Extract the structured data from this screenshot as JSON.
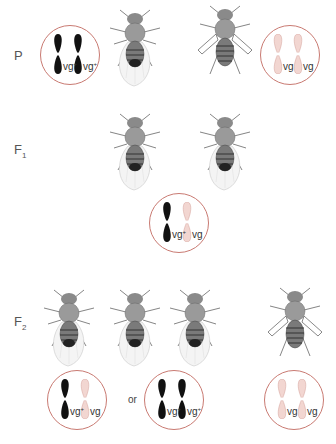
{
  "colors": {
    "circle_border": "#c97a72",
    "dominant_chromosome": "#111111",
    "recessive_chromosome": "#f2d6d1",
    "recessive_chromosome_outline": "#d9aaa3",
    "fly_body": "#777777"
  },
  "generations": [
    {
      "label": "P",
      "subscript": "",
      "flies": [
        {
          "phenotype": "wild-type",
          "wings": "normal"
        },
        {
          "phenotype": "vestigial",
          "wings": "vestigial"
        }
      ],
      "genotypes": [
        {
          "alleles": [
            {
              "text": "vg",
              "sup": "+",
              "type": "dominant"
            },
            {
              "text": "vg",
              "sup": "+",
              "type": "dominant"
            }
          ]
        },
        {
          "alleles": [
            {
              "text": "vg",
              "sup": "",
              "type": "recessive"
            },
            {
              "text": "vg",
              "sup": "",
              "type": "recessive"
            }
          ]
        }
      ]
    },
    {
      "label": "F",
      "subscript": "1",
      "flies": [
        {
          "phenotype": "wild-type",
          "wings": "normal"
        },
        {
          "phenotype": "wild-type",
          "wings": "normal"
        }
      ],
      "genotypes": [
        {
          "alleles": [
            {
              "text": "vg",
              "sup": "+",
              "type": "dominant"
            },
            {
              "text": "vg",
              "sup": "",
              "type": "recessive"
            }
          ]
        }
      ]
    },
    {
      "label": "F",
      "subscript": "2",
      "flies": [
        {
          "phenotype": "wild-type",
          "wings": "normal"
        },
        {
          "phenotype": "wild-type",
          "wings": "normal"
        },
        {
          "phenotype": "wild-type",
          "wings": "normal"
        },
        {
          "phenotype": "vestigial",
          "wings": "vestigial"
        }
      ],
      "genotypes": [
        {
          "alleles": [
            {
              "text": "vg",
              "sup": "+",
              "type": "dominant"
            },
            {
              "text": "vg",
              "sup": "",
              "type": "recessive"
            }
          ]
        },
        {
          "alleles": [
            {
              "text": "vg",
              "sup": "+",
              "type": "dominant"
            },
            {
              "text": "vg",
              "sup": "+",
              "type": "dominant"
            }
          ]
        },
        {
          "alleles": [
            {
              "text": "vg",
              "sup": "",
              "type": "recessive"
            },
            {
              "text": "vg",
              "sup": "",
              "type": "recessive"
            }
          ]
        }
      ],
      "separator": "or"
    }
  ]
}
